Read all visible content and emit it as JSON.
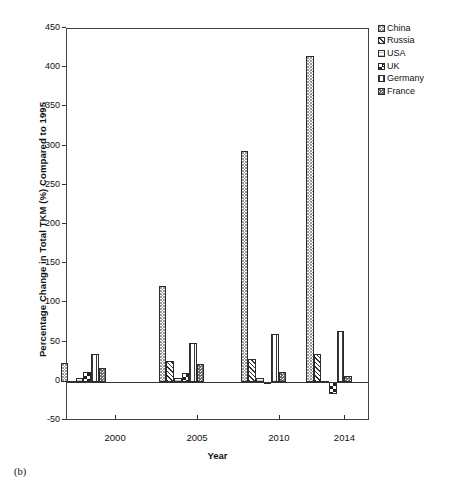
{
  "figure": {
    "caption": "(b)"
  },
  "chart_data": {
    "type": "bar",
    "title": "",
    "xlabel": "Year",
    "ylabel": "Percentage Change in Total TKM (%) Compared to 1995",
    "ylim": [
      -50,
      450
    ],
    "ytick_step": 50,
    "yticks": [
      450,
      400,
      350,
      300,
      250,
      200,
      150,
      100,
      50,
      0,
      -50
    ],
    "ytick_labels": [
      "450",
      "400",
      "350",
      "300",
      "250",
      "200",
      "150",
      "100",
      "50",
      "0",
      "-50"
    ],
    "xlim": [
      1997,
      2015.5
    ],
    "xticks": [
      2000,
      2005,
      2010,
      2014
    ],
    "xtick_labels": [
      "2000",
      "2005",
      "2010",
      "2014"
    ],
    "grid": false,
    "legend_position": "right",
    "groups": [
      1998,
      2004,
      2009,
      2013
    ],
    "categories": [
      "1998",
      "2004",
      "2009",
      "2013"
    ],
    "series": [
      {
        "name": "China",
        "pattern": "fine-dotted",
        "values": [
          24,
          122,
          294,
          415
        ]
      },
      {
        "name": "Russia",
        "pattern": "diagonal-hatch",
        "values": [
          1,
          27,
          29,
          36
        ]
      },
      {
        "name": "USA",
        "pattern": "horizontal-lines",
        "values": [
          5,
          5,
          5,
          1
        ]
      },
      {
        "name": "UK",
        "pattern": "checkerboard",
        "values": [
          12,
          11,
          -2,
          -15
        ]
      },
      {
        "name": "Germany",
        "pattern": "vertical-lines",
        "values": [
          35,
          50,
          61,
          65
        ]
      },
      {
        "name": "France",
        "pattern": "coarse-dotted",
        "values": [
          17,
          23,
          13,
          7
        ]
      }
    ]
  },
  "legend": {
    "items": [
      {
        "label": "China"
      },
      {
        "label": "Russia"
      },
      {
        "label": "USA"
      },
      {
        "label": "UK"
      },
      {
        "label": "Germany"
      },
      {
        "label": "France"
      }
    ]
  }
}
